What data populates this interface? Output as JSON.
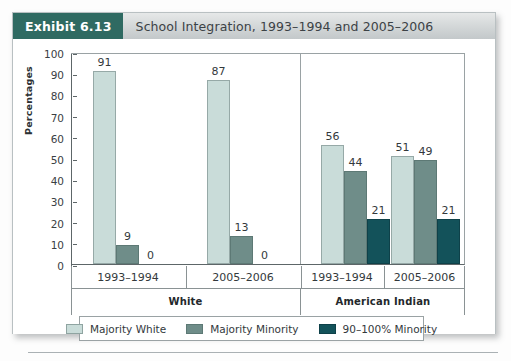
{
  "exhibit": {
    "badge": "Exhibit 6.13",
    "title": "School Integration, 1993–1994 and 2005–2006"
  },
  "colors": {
    "badge_bg": "#2f6a62",
    "header_bg": "#d2d6d7",
    "majority_white": "#c9dcd9",
    "majority_minority": "#6f8d89",
    "minority_90_100": "#13525a",
    "axis": "#5d6668"
  },
  "chart_data": {
    "type": "bar",
    "title": "School Integration, 1993–1994 and 2005–2006",
    "xlabel": "",
    "ylabel": "Percentages",
    "ylim": [
      0,
      100
    ],
    "ytick_step": 10,
    "yticks": [
      100,
      90,
      80,
      70,
      60,
      50,
      40,
      30,
      20,
      10,
      0
    ],
    "grid": false,
    "legend_position": "bottom",
    "legend": [
      "Majority White",
      "Majority Minority",
      "90–100% Minority"
    ],
    "groups": [
      {
        "name": "White",
        "categories": [
          "1993–1994",
          "2005–2006"
        ]
      },
      {
        "name": "American Indian",
        "categories": [
          "1993–1994",
          "2005–2006"
        ]
      }
    ],
    "categories": [
      "White 1993–1994",
      "White 2005–2006",
      "American Indian 1993–1994",
      "American Indian 2005–2006"
    ],
    "series": [
      {
        "name": "Majority White",
        "color": "#c9dcd9",
        "values": [
          91,
          87,
          56,
          51
        ]
      },
      {
        "name": "Majority Minority",
        "color": "#6f8d89",
        "values": [
          9,
          13,
          44,
          49
        ]
      },
      {
        "name": "90–100% Minority",
        "color": "#13525a",
        "values": [
          0,
          0,
          21,
          21
        ]
      }
    ]
  }
}
